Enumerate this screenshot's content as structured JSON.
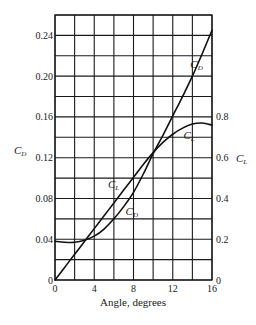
{
  "chart_data": {
    "type": "line",
    "title": "",
    "xlabel": "Angle, degrees",
    "ylabel_left": "C_D",
    "ylabel_right": "C_L",
    "xlim": [
      0,
      16
    ],
    "ylim_left": [
      0,
      0.26
    ],
    "ylim_right": [
      0,
      1.3
    ],
    "grid": true,
    "x_ticks": [
      0,
      4,
      8,
      12,
      16
    ],
    "x_tick_labels": [
      "0",
      "4",
      "8",
      "12",
      "16"
    ],
    "y_left_ticks": [
      0,
      0.04,
      0.08,
      0.12,
      0.16,
      0.2,
      0.24
    ],
    "y_left_tick_labels": [
      "0",
      "0.04",
      "0.08",
      "0.12",
      "0.16",
      "0.20",
      "0.24"
    ],
    "y_right_ticks": [
      0,
      0.2,
      0.4,
      0.6,
      0.8
    ],
    "y_right_tick_labels": [
      "0",
      "0.2",
      "0.4",
      "0.6",
      "0.8"
    ],
    "series": [
      {
        "name": "C_D",
        "axis": "left",
        "x": [
          0,
          1,
          2,
          3,
          4,
          5,
          6,
          7,
          8,
          9,
          10,
          11,
          12,
          13,
          14,
          15,
          16
        ],
        "values": [
          0.038,
          0.037,
          0.037,
          0.039,
          0.043,
          0.05,
          0.06,
          0.072,
          0.086,
          0.104,
          0.124,
          0.142,
          0.161,
          0.18,
          0.2,
          0.222,
          0.245
        ],
        "label_positions": [
          {
            "x": 7.6,
            "y": 0.064
          },
          {
            "x": 14.2,
            "y": 0.208
          }
        ]
      },
      {
        "name": "C_L",
        "axis": "right",
        "x": [
          0,
          1,
          2,
          3,
          4,
          5,
          6,
          7,
          8,
          9,
          10,
          11,
          12,
          13,
          14,
          15,
          16
        ],
        "values": [
          0.0,
          0.063,
          0.126,
          0.189,
          0.252,
          0.315,
          0.378,
          0.441,
          0.504,
          0.567,
          0.625,
          0.675,
          0.715,
          0.745,
          0.765,
          0.77,
          0.76
        ],
        "label_positions": [
          {
            "x": 5.8,
            "y": 0.45
          },
          {
            "x": 13.5,
            "y": 0.69
          }
        ]
      }
    ]
  }
}
